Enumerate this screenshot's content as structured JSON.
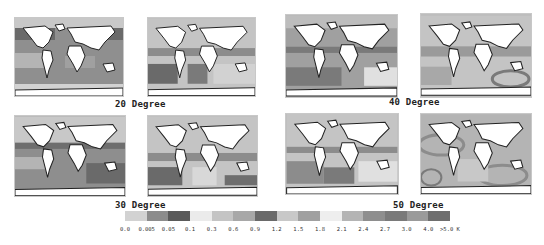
{
  "figure": {
    "groups": [
      {
        "label": "20 Degree",
        "maps": [
          "map-20-a",
          "map-20-b"
        ]
      },
      {
        "label": "30 Degree",
        "maps": [
          "map-30-a",
          "map-30-b"
        ]
      },
      {
        "label": "40 Degree",
        "maps": [
          "map-40-a",
          "map-40-b"
        ]
      },
      {
        "label": "50 Degree",
        "maps": [
          "map-50-a",
          "map-50-b"
        ]
      }
    ],
    "colorbar": {
      "unit": "K",
      "bins": [
        {
          "color": "#d2d2d2"
        },
        {
          "color": "#8c8c8c"
        },
        {
          "color": "#5a5a5a"
        },
        {
          "color": "#ebebeb"
        },
        {
          "color": "#c4c4c4"
        },
        {
          "color": "#a8a8a8"
        },
        {
          "color": "#6a6a6a"
        },
        {
          "color": "#c8c8c8"
        },
        {
          "color": "#a0a0a0"
        },
        {
          "color": "#eeeeee"
        },
        {
          "color": "#b4b4b4"
        },
        {
          "color": "#8e8e8e"
        },
        {
          "color": "#7a7a7a"
        },
        {
          "color": "#9a9a9a"
        },
        {
          "color": "#6e6e6e"
        }
      ],
      "tick_labels": [
        "0.0",
        "0.005",
        "0.05",
        "0.1",
        "0.3",
        "0.6",
        "0.9",
        "1.2",
        "1.5",
        "1.8",
        "2.1",
        "2.4",
        "2.7",
        "3.0",
        "4.0",
        ">5.0 K"
      ]
    }
  }
}
